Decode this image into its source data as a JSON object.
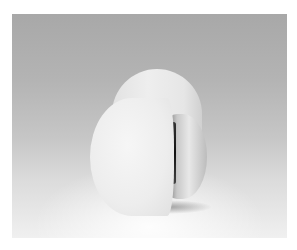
{
  "image": {
    "description": "Black-and-white photograph of a white cylindrical sculpture with a curved cut revealing a dark slit and reflective inner surface, on a gradient grey studio backdrop",
    "colors": {
      "border": "#ffffff",
      "backdrop_top": "#a8a8a8",
      "backdrop_bottom": "#f0f0f0",
      "object": "#ececec",
      "slit": "#111111"
    }
  }
}
